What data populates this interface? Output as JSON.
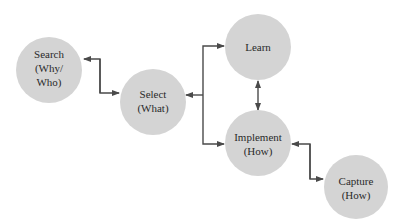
{
  "diagram": {
    "nodes": [
      {
        "id": "search",
        "lines": [
          "Search",
          "(Why/",
          "Who)"
        ]
      },
      {
        "id": "select",
        "lines": [
          "Select",
          "(What)"
        ]
      },
      {
        "id": "learn",
        "lines": [
          "Learn"
        ]
      },
      {
        "id": "implement",
        "lines": [
          "Implement",
          "(How)"
        ]
      },
      {
        "id": "capture",
        "lines": [
          "Capture",
          "(How)"
        ]
      }
    ],
    "edges": [
      {
        "from": "search",
        "to": "select",
        "direction": "bidirectional"
      },
      {
        "from": "select",
        "to": "learn",
        "direction": "select-to-learn, learn-to-select"
      },
      {
        "from": "select",
        "to": "implement",
        "direction": "to implement"
      },
      {
        "from": "learn",
        "to": "implement",
        "direction": "bidirectional"
      },
      {
        "from": "implement",
        "to": "capture",
        "direction": "bidirectional"
      }
    ],
    "colors": {
      "node_fill": "#d4d4d4",
      "line": "#4a4a4a",
      "text": "#2a2a2a"
    }
  }
}
